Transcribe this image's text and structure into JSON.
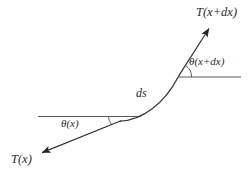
{
  "figure": {
    "title": "",
    "background_color": "#ffffff",
    "stroke_color": "#3a3a3a",
    "guide_color": "#5a5a5a",
    "text_color": "#2b2b2b"
  },
  "labels": {
    "tension_upper": "T(x+dx)",
    "tension_lower": "T(x)",
    "angle_upper": "θ(x+dx)",
    "angle_lower": "θ(x)",
    "arc_length": "ds"
  },
  "diagram_data": {
    "type": "vector-force-diagram",
    "description": "Tension forces acting at the two ends of an infinitesimal curved string element of arc length ds, with tangent angles measured from the horizontal.",
    "curve": {
      "name": "string-element",
      "start": [
        120,
        121
      ],
      "end": [
        178,
        77
      ],
      "control_points": [
        [
          142,
          120
        ],
        [
          164,
          102
        ]
      ]
    },
    "vectors": [
      {
        "name": "tension-upper",
        "label": "T(x+dx)",
        "tail": [
          178,
          77
        ],
        "head": [
          209,
          28
        ],
        "direction": "up-right",
        "arrowhead": "filled"
      },
      {
        "name": "tension-lower",
        "label": "T(x)",
        "tail": [
          120,
          121
        ],
        "head": [
          41,
          153
        ],
        "direction": "down-left",
        "arrowhead": "filled"
      }
    ],
    "reference_lines": [
      {
        "name": "horizontal-reference-lower",
        "from": [
          38,
          116
        ],
        "to": [
          140,
          116
        ],
        "orientation": "horizontal"
      },
      {
        "name": "horizontal-reference-upper",
        "from": [
          178,
          77
        ],
        "to": [
          240,
          77
        ],
        "orientation": "horizontal"
      }
    ],
    "angles": [
      {
        "name": "theta-lower",
        "label": "θ(x)",
        "vertex": [
          120,
          121
        ],
        "between": [
          "horizontal-reference-lower",
          "tension-lower-tangent"
        ],
        "approx_degrees": 22
      },
      {
        "name": "theta-upper",
        "label": "θ(x+dx)",
        "vertex": [
          178,
          77
        ],
        "between": [
          "horizontal-reference-upper",
          "tension-upper"
        ],
        "approx_degrees": 58
      }
    ]
  }
}
